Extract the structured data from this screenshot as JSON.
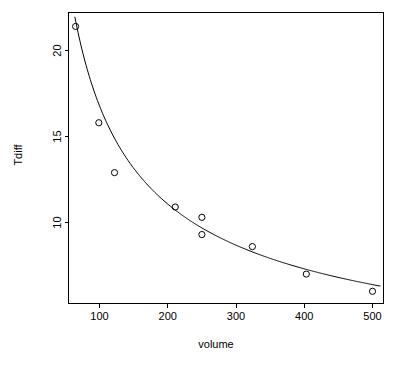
{
  "chart_data": {
    "type": "scatter",
    "title": "",
    "xlabel": "volume",
    "ylabel": "Tdiff",
    "xlim": [
      50,
      520
    ],
    "ylim": [
      5.4,
      22.3
    ],
    "grid": false,
    "legend": null,
    "x_ticks": [
      100,
      200,
      300,
      400,
      500
    ],
    "x_tick_labels": [
      "100",
      "200",
      "300",
      "400",
      "500"
    ],
    "y_ticks": [
      10,
      15,
      20
    ],
    "y_tick_labels": [
      "10",
      "15",
      "20"
    ],
    "x": [
      65,
      99,
      122,
      211,
      250,
      250,
      324,
      403,
      500
    ],
    "y": [
      21.4,
      15.8,
      12.9,
      10.9,
      10.3,
      9.3,
      8.6,
      7.0,
      6.0
    ],
    "points": [
      {
        "volume": 65,
        "Tdiff": 21.4
      },
      {
        "volume": 99,
        "Tdiff": 15.8
      },
      {
        "volume": 122,
        "Tdiff": 12.9
      },
      {
        "volume": 211,
        "Tdiff": 10.9
      },
      {
        "volume": 250,
        "Tdiff": 10.3
      },
      {
        "volume": 250,
        "Tdiff": 9.3
      },
      {
        "volume": 324,
        "Tdiff": 8.6
      },
      {
        "volume": 403,
        "Tdiff": 7.0
      },
      {
        "volume": 500,
        "Tdiff": 6.0
      }
    ],
    "series": [
      {
        "name": "observations",
        "type": "scatter",
        "marker": "open-circle",
        "color": "#000000",
        "values": [
          21.4,
          15.8,
          12.9,
          10.9,
          10.3,
          9.3,
          8.6,
          7.0,
          6.0
        ]
      },
      {
        "name": "fitted-curve",
        "type": "line",
        "color": "#000000",
        "model": "power-decay",
        "equation": "Tdiff = 266 * volume^-0.6",
        "coef_a": 266,
        "coef_b": -0.6
      }
    ]
  },
  "axes": {
    "x_title": "volume",
    "y_title": "Tdiff"
  },
  "colors": {
    "foreground": "#000000",
    "background": "#ffffff"
  }
}
